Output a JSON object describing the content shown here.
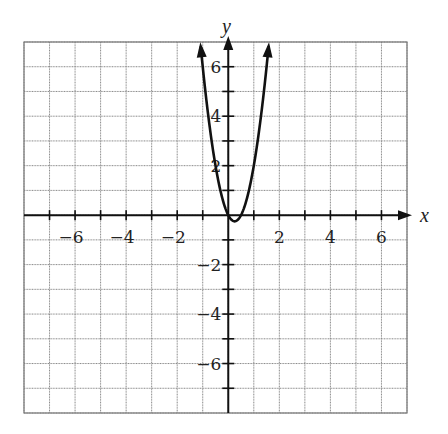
{
  "chart_data": {
    "type": "line",
    "title": "",
    "xlabel": "x",
    "ylabel": "y",
    "xlim": [
      -8,
      7
    ],
    "ylim": [
      -8,
      7
    ],
    "grid": true,
    "x_ticks": [
      -7,
      -6,
      -5,
      -4,
      -3,
      -2,
      -1,
      1,
      2,
      3,
      4,
      5,
      6
    ],
    "y_ticks": [
      -7,
      -6,
      -5,
      -4,
      -3,
      -2,
      -1,
      1,
      2,
      3,
      4,
      5,
      6
    ],
    "x_tick_labels": [
      {
        "value": -6,
        "text": "−6"
      },
      {
        "value": -4,
        "text": "−4"
      },
      {
        "value": -2,
        "text": "−2"
      },
      {
        "value": 2,
        "text": "2"
      },
      {
        "value": 4,
        "text": "4"
      },
      {
        "value": 6,
        "text": "6"
      }
    ],
    "y_tick_labels": [
      {
        "value": 6,
        "text": "6"
      },
      {
        "value": 4,
        "text": "4"
      },
      {
        "value": 2,
        "text": "2"
      },
      {
        "value": -2,
        "text": "−2"
      },
      {
        "value": -4,
        "text": "−4"
      },
      {
        "value": -6,
        "text": "−6"
      }
    ],
    "series": [
      {
        "name": "parabola",
        "equation": "y = 4x^2 - 2x",
        "x_range": [
          -1.08,
          1.58
        ],
        "arrows_at_ends": true,
        "points": [
          {
            "x": -1.0,
            "y": 6.0
          },
          {
            "x": -0.5,
            "y": 2.0
          },
          {
            "x": 0.0,
            "y": 0.0
          },
          {
            "x": 0.25,
            "y": -0.25
          },
          {
            "x": 0.5,
            "y": 0.0
          },
          {
            "x": 1.0,
            "y": 2.0
          },
          {
            "x": 1.5,
            "y": 6.0
          }
        ]
      }
    ]
  },
  "colors": {
    "grid": "#8a8a8a",
    "axis": "#111111",
    "curve": "#111111",
    "background": "#ffffff"
  }
}
